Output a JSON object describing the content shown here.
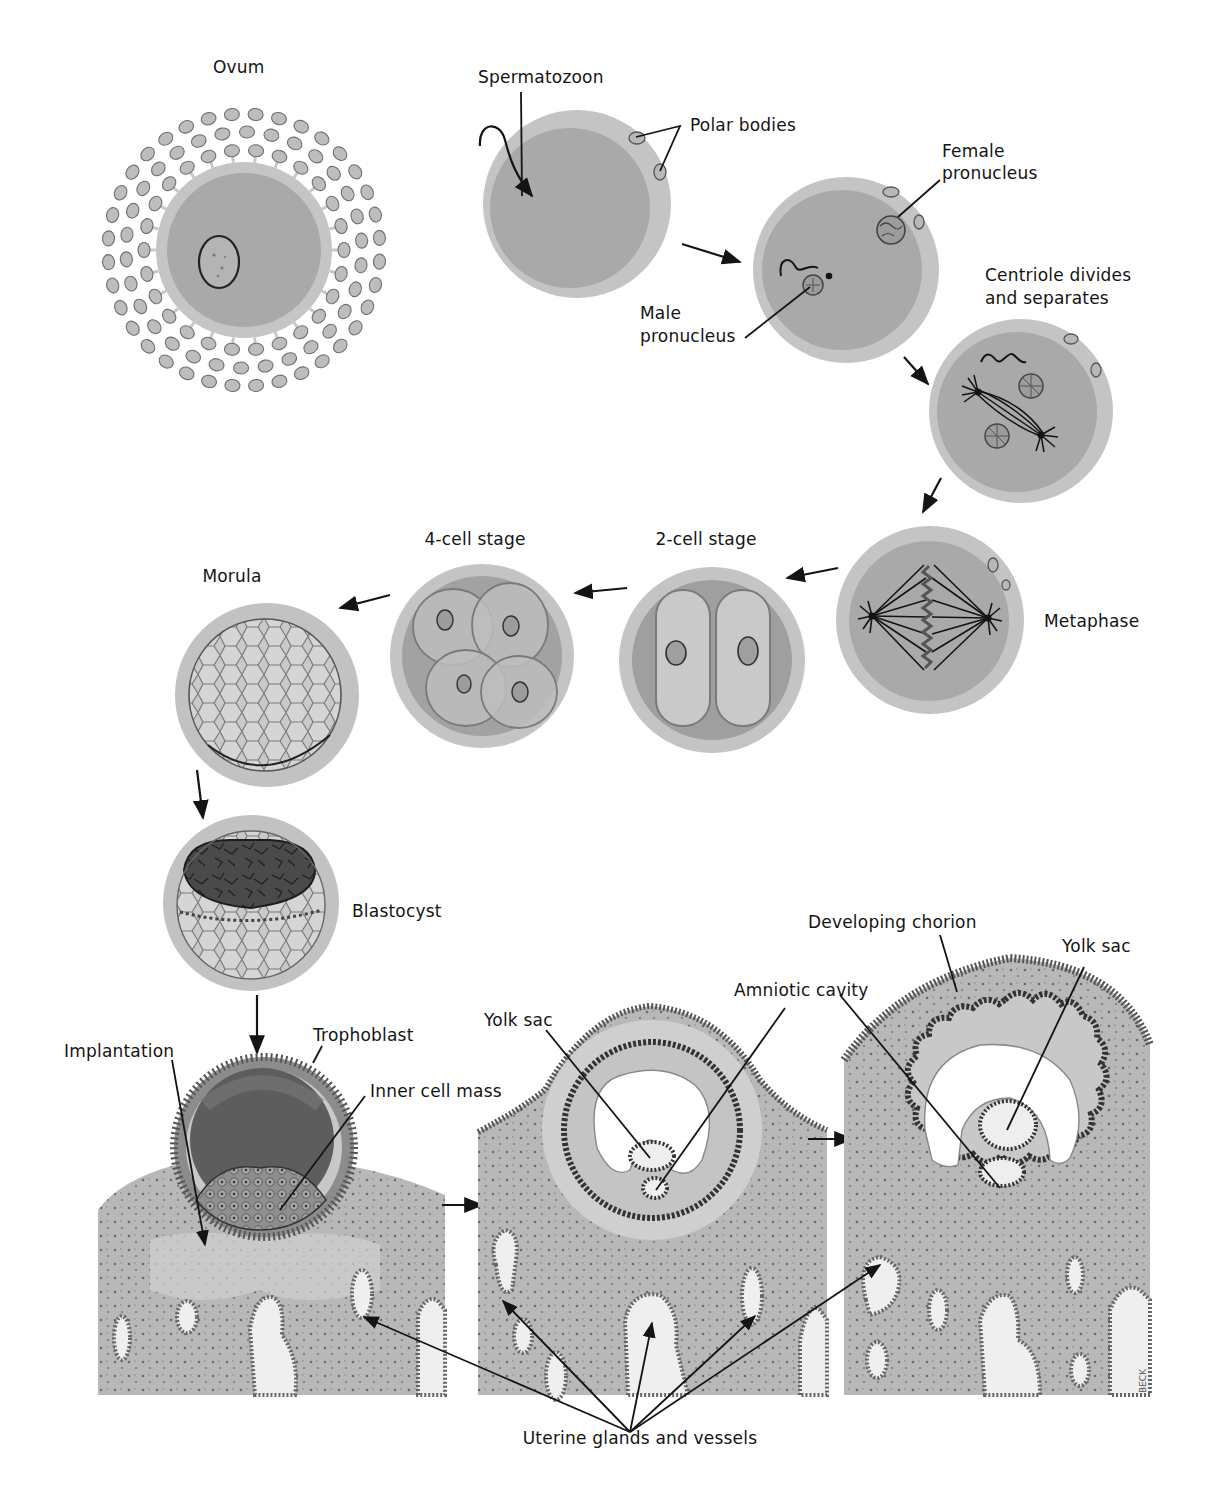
{
  "figure": {
    "colors": {
      "background": "#ffffff",
      "cytoplasm": "#a8a8a8",
      "zona": "#c4c4c4",
      "tissue": "#b5b5b5",
      "tissue_light": "#d6d6d6",
      "ink": "#141414",
      "gland": "#efefef"
    },
    "signature": "BECK"
  },
  "stages": [
    {
      "id": "ovum",
      "label": "Ovum"
    },
    {
      "id": "fertilization",
      "labels": [
        "Spermatozoon",
        "Polar bodies"
      ]
    },
    {
      "id": "pronuclei",
      "labels": [
        "Female pronucleus",
        "Male pronucleus"
      ]
    },
    {
      "id": "centriole",
      "label": "Centriole divides and separates"
    },
    {
      "id": "metaphase",
      "label": "Metaphase"
    },
    {
      "id": "two-cell",
      "label": "2-cell stage"
    },
    {
      "id": "four-cell",
      "label": "4-cell stage"
    },
    {
      "id": "morula",
      "label": "Morula"
    },
    {
      "id": "blastocyst",
      "label": "Blastocyst"
    },
    {
      "id": "implantation",
      "labels": [
        "Implantation",
        "Trophoblast",
        "Inner cell mass"
      ]
    },
    {
      "id": "early-embryo",
      "labels": [
        "Yolk sac",
        "Amniotic cavity"
      ]
    },
    {
      "id": "chorion",
      "labels": [
        "Developing chorion",
        "Yolk sac"
      ]
    }
  ],
  "labels": {
    "ovum": "Ovum",
    "spermatozoon": "Spermatozoon",
    "polar_bodies": "Polar bodies",
    "female_pronucleus_1": "Female",
    "female_pronucleus_2": "pronucleus",
    "male_pronucleus_1": "Male",
    "male_pronucleus_2": "pronucleus",
    "centriole_1": "Centriole divides",
    "centriole_2": "and separates",
    "metaphase": "Metaphase",
    "two_cell": "2-cell stage",
    "four_cell": "4-cell stage",
    "morula": "Morula",
    "blastocyst": "Blastocyst",
    "implantation": "Implantation",
    "trophoblast": "Trophoblast",
    "inner_cell_mass": "Inner cell mass",
    "yolk_sac_1": "Yolk sac",
    "amniotic_cavity": "Amniotic cavity",
    "developing_chorion": "Developing chorion",
    "yolk_sac_2": "Yolk sac",
    "uterine_glands": "Uterine glands and vessels"
  }
}
